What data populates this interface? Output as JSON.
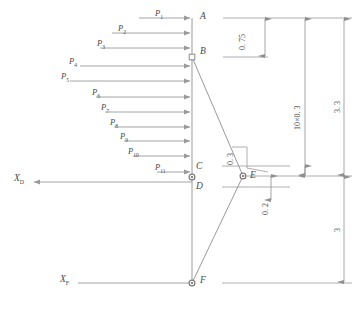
{
  "figure": {
    "type": "structural-frame-load-diagram",
    "caption": "",
    "line_color": "#9a9a9a",
    "text_color": "#4a4a4a",
    "background": "#ffffff"
  },
  "loads": [
    {
      "label": "P",
      "index": "1"
    },
    {
      "label": "P",
      "index": "2"
    },
    {
      "label": "P",
      "index": "3"
    },
    {
      "label": "P",
      "index": "4"
    },
    {
      "label": "P",
      "index": "5"
    },
    {
      "label": "P",
      "index": "6"
    },
    {
      "label": "P",
      "index": "7"
    },
    {
      "label": "P",
      "index": "8"
    },
    {
      "label": "P",
      "index": "9"
    },
    {
      "label": "P",
      "index": "10"
    },
    {
      "label": "P",
      "index": "11"
    }
  ],
  "nodes": [
    {
      "id": "A",
      "label": "A"
    },
    {
      "id": "B",
      "label": "B"
    },
    {
      "id": "C",
      "label": "C"
    },
    {
      "id": "D",
      "label": "D"
    },
    {
      "id": "E",
      "label": "E"
    },
    {
      "id": "F",
      "label": "F"
    }
  ],
  "axes": [
    {
      "id": "XD",
      "label": "X",
      "sub": "D"
    },
    {
      "id": "XF",
      "label": "X",
      "sub": "F"
    }
  ],
  "dimensions": [
    {
      "id": "d-075",
      "value": "0. 75"
    },
    {
      "id": "d-10x03",
      "value": "10×0. 3"
    },
    {
      "id": "d-33",
      "value": "3. 3"
    },
    {
      "id": "d-03",
      "value": "0. 3"
    },
    {
      "id": "d-02",
      "value": "0. 2"
    },
    {
      "id": "d-3",
      "value": "3"
    }
  ]
}
